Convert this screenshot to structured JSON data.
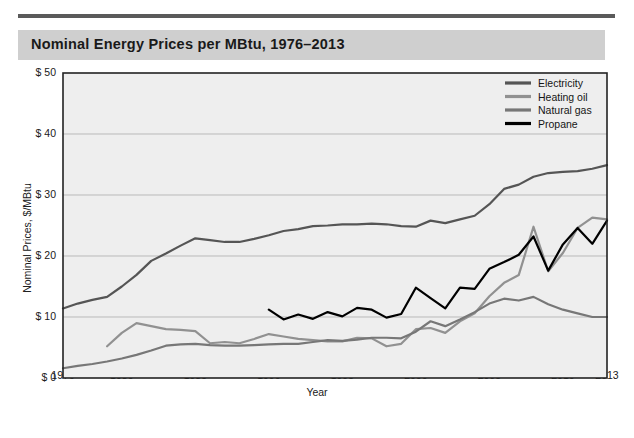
{
  "header": {
    "title": "Nominal Energy Prices per MBtu, 1976–2013"
  },
  "colors": {
    "band": "#cfcfcf",
    "rule": "#5a5a5a",
    "plot_bg": "#eeeeee",
    "grid": "#b9b9b9",
    "axis": "#222222",
    "electricity": "#555555",
    "heating_oil": "#919191",
    "natural_gas": "#777777",
    "propane": "#000000"
  },
  "chart_data": {
    "type": "line",
    "title": "Nominal Energy Prices per MBtu, 1976–2013",
    "xlabel": "Year",
    "ylabel": "Nominal Prices, $/MBtu",
    "xlim": [
      1976,
      2013
    ],
    "ylim": [
      0,
      50
    ],
    "yticks": [
      0,
      10,
      20,
      30,
      40,
      50
    ],
    "ytick_labels": [
      "$ 0",
      "$ 10",
      "$ 20",
      "$ 30",
      "$ 40",
      "$ 50"
    ],
    "xticks": [
      1976,
      1980,
      1985,
      1990,
      1995,
      2000,
      2005,
      2010,
      2013
    ],
    "xtick_labels": [
      "1976",
      "1980",
      "1985",
      "1990",
      "1995",
      "2000",
      "2005",
      "2010",
      "2013"
    ],
    "grid": "horizontal",
    "legend_position": "top-right",
    "series": [
      {
        "name": "Electricity",
        "color": "#555555",
        "x": [
          1976,
          1977,
          1978,
          1979,
          1980,
          1981,
          1982,
          1983,
          1984,
          1985,
          1986,
          1987,
          1988,
          1989,
          1990,
          1991,
          1992,
          1993,
          1994,
          1995,
          1996,
          1997,
          1998,
          1999,
          2000,
          2001,
          2002,
          2003,
          2004,
          2005,
          2006,
          2007,
          2008,
          2009,
          2010,
          2011,
          2012,
          2013
        ],
        "values": [
          11.4,
          12.2,
          12.8,
          13.3,
          15.0,
          16.9,
          19.2,
          20.4,
          21.7,
          22.9,
          22.6,
          22.3,
          22.3,
          22.8,
          23.4,
          24.1,
          24.4,
          24.9,
          25.0,
          25.2,
          25.2,
          25.3,
          25.2,
          24.9,
          24.8,
          25.8,
          25.4,
          26.0,
          26.6,
          28.5,
          31.0,
          31.7,
          33.0,
          33.6,
          33.8,
          33.9,
          34.3,
          34.9
        ]
      },
      {
        "name": "Heating oil",
        "color": "#919191",
        "x": [
          1979,
          1980,
          1981,
          1982,
          1983,
          1984,
          1985,
          1986,
          1987,
          1988,
          1989,
          1990,
          1991,
          1992,
          1993,
          1994,
          1995,
          1996,
          1997,
          1998,
          1999,
          2000,
          2001,
          2002,
          2003,
          2004,
          2005,
          2006,
          2007,
          2008,
          2009,
          2010,
          2011,
          2012,
          2013
        ],
        "values": [
          5.2,
          7.4,
          9.0,
          8.5,
          8.0,
          7.9,
          7.7,
          5.7,
          5.9,
          5.7,
          6.4,
          7.2,
          6.8,
          6.4,
          6.2,
          6.0,
          6.0,
          6.6,
          6.5,
          5.2,
          5.6,
          8.0,
          8.2,
          7.4,
          9.3,
          10.6,
          13.4,
          15.6,
          16.9,
          24.8,
          17.5,
          20.5,
          24.6,
          26.3,
          26.0
        ]
      },
      {
        "name": "Natural gas",
        "color": "#777777",
        "x": [
          1976,
          1977,
          1978,
          1979,
          1980,
          1981,
          1982,
          1983,
          1984,
          1985,
          1986,
          1987,
          1988,
          1989,
          1990,
          1991,
          1992,
          1993,
          1994,
          1995,
          1996,
          1997,
          1998,
          1999,
          2000,
          2001,
          2002,
          2003,
          2004,
          2005,
          2006,
          2007,
          2008,
          2009,
          2010,
          2011,
          2012,
          2013
        ],
        "values": [
          1.6,
          2.0,
          2.3,
          2.7,
          3.2,
          3.8,
          4.5,
          5.3,
          5.5,
          5.6,
          5.4,
          5.3,
          5.3,
          5.4,
          5.5,
          5.6,
          5.6,
          5.9,
          6.2,
          6.1,
          6.3,
          6.6,
          6.6,
          6.5,
          7.6,
          9.3,
          8.5,
          9.6,
          10.8,
          12.2,
          13.0,
          12.7,
          13.3,
          12.1,
          11.2,
          10.6,
          10.0,
          10.0
        ]
      },
      {
        "name": "Propane",
        "color": "#000000",
        "x": [
          1990,
          1991,
          1992,
          1993,
          1994,
          1995,
          1996,
          1997,
          1998,
          1999,
          2000,
          2001,
          2002,
          2003,
          2004,
          2005,
          2006,
          2007,
          2008,
          2009,
          2010,
          2011,
          2012,
          2013
        ],
        "values": [
          11.2,
          9.6,
          10.4,
          9.7,
          10.8,
          10.1,
          11.5,
          11.2,
          9.9,
          10.5,
          14.8,
          13.1,
          11.4,
          14.8,
          14.6,
          17.9,
          19.0,
          20.2,
          23.2,
          17.6,
          21.9,
          24.6,
          22.0,
          25.8
        ]
      }
    ]
  },
  "legend": {
    "items": [
      {
        "label": "Electricity"
      },
      {
        "label": "Heating oil"
      },
      {
        "label": "Natural gas"
      },
      {
        "label": "Propane"
      }
    ]
  }
}
